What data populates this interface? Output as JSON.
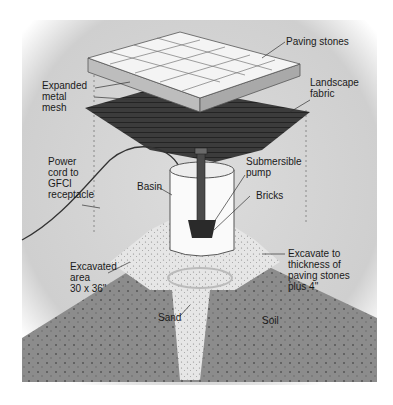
{
  "diagram": {
    "type": "exploded-view illustration",
    "labels": {
      "paving_stones": "Paving stones",
      "expanded_metal_mesh": "Expanded\nmetal\nmesh",
      "landscape_fabric": "Landscape\nfabric",
      "power_cord": "Power\ncord to\nGFCI\nreceptacle",
      "basin": "Basin",
      "submersible_pump": "Submersible\npump",
      "bricks": "Bricks",
      "excavated_area": "Excavated\narea\n30 x 36\"",
      "excavate_depth": "Excavate to\nthickness of\npaving stones\nplus 4\"",
      "sand": "Sand",
      "soil": "Soil"
    },
    "colors": {
      "background": "#d4d4d4",
      "paving": "#f2f2f2",
      "fabric": "#3a3a3a",
      "soil": "#8a8a8a",
      "sand": "#e8e8e8",
      "basin": "#ffffff"
    }
  }
}
